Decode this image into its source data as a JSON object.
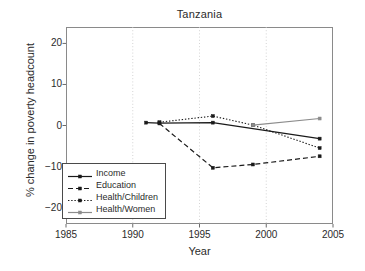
{
  "chart_data": {
    "type": "line",
    "title": "Tanzania",
    "xlabel": "Year",
    "ylabel": "% change in poverty headcount",
    "xlim": [
      1985,
      2005
    ],
    "ylim": [
      -24,
      24
    ],
    "xticks": [
      1985,
      1990,
      1995,
      2000,
      2005
    ],
    "yticks": [
      20,
      10,
      0,
      -10,
      -20
    ],
    "xtick_labels": [
      "1985",
      "1990",
      "1995",
      "2000",
      "2005"
    ],
    "ytick_labels": [
      "20",
      "10",
      "0",
      "−10",
      "−20"
    ],
    "grid": "vertical dotted gridlines at 1990, 1995, 2000",
    "legend_position": "lower left inside axes",
    "series": [
      {
        "name": "Income",
        "style": "solid",
        "color": "#1a1a1a",
        "marker": "square",
        "x": [
          1991,
          1992,
          1996,
          2004
        ],
        "y": [
          0.7,
          0.6,
          0.7,
          -3.2
        ]
      },
      {
        "name": "Education",
        "style": "dashed",
        "color": "#1a1a1a",
        "marker": "square",
        "x": [
          1992,
          1996,
          1999,
          2004
        ],
        "y": [
          0.5,
          -10.3,
          -9.5,
          -7.5
        ]
      },
      {
        "name": "Health/Children",
        "style": "dotted",
        "color": "#1a1a1a",
        "marker": "square",
        "x": [
          1992,
          1996,
          1999,
          2004
        ],
        "y": [
          0.8,
          2.3,
          0.1,
          -5.5
        ]
      },
      {
        "name": "Health/Women",
        "style": "solid",
        "color": "#8c8c8c",
        "marker": "square",
        "x": [
          1999,
          2004
        ],
        "y": [
          0.1,
          1.7
        ]
      }
    ]
  }
}
